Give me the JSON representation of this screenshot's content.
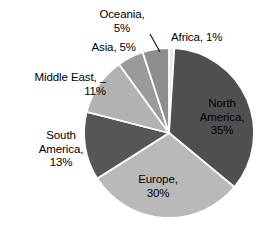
{
  "chart_data": {
    "type": "pie",
    "title": "",
    "subtitle": "",
    "xlabel": "",
    "ylabel": "",
    "legend_position": "none",
    "grid": false,
    "start_angle_deg": 0,
    "direction": "clockwise",
    "categories": [
      "Africa",
      "North America",
      "Europe",
      "South America",
      "Middle East",
      "Asia",
      "Oceania"
    ],
    "values": [
      1,
      35,
      30,
      13,
      11,
      5,
      5
    ],
    "units": "%",
    "slices": [
      {
        "name": "Africa",
        "value": 1,
        "label": "Africa, 1%",
        "color": "#e8e8e8",
        "label_placement": "outside"
      },
      {
        "name": "North America",
        "value": 35,
        "label": "North\nAmerica,\n35%",
        "color": "#4f4f4f",
        "label_placement": "inside"
      },
      {
        "name": "Europe",
        "value": 30,
        "label": "Europe,\n30%",
        "color": "#b9b9b9",
        "label_placement": "inside"
      },
      {
        "name": "South America",
        "value": 13,
        "label": "South\nAmerica,\n13%",
        "color": "#565656",
        "label_placement": "outside"
      },
      {
        "name": "Middle East",
        "value": 11,
        "label": "Middle East,\n11%",
        "color": "#b2b2b2",
        "label_placement": "outside"
      },
      {
        "name": "Asia",
        "value": 5,
        "label": "Asia, 5%",
        "color": "#9a9a9a",
        "label_placement": "outside"
      },
      {
        "name": "Oceania",
        "value": 5,
        "label": "Oceania,\n5%",
        "color": "#8e8e8e",
        "label_placement": "outside"
      }
    ]
  },
  "labels": {
    "oceania_line1": "Oceania,",
    "oceania_line2": "5%",
    "africa": "Africa, 1%",
    "asia": "Asia, 5%",
    "middle_east_line1": "Middle East, _",
    "middle_east_line2": "11%",
    "south_america_line1": "South",
    "south_america_line2": "America,",
    "south_america_line3": "13%",
    "north_america_line1": "North",
    "north_america_line2": "America,",
    "north_america_line3": "35%",
    "europe_line1": "Europe,",
    "europe_line2": "30%"
  },
  "colors": {
    "background": "#ffffff",
    "slice_border": "#ffffff",
    "text": "#000000",
    "leader_line": "#1a1a1a"
  }
}
